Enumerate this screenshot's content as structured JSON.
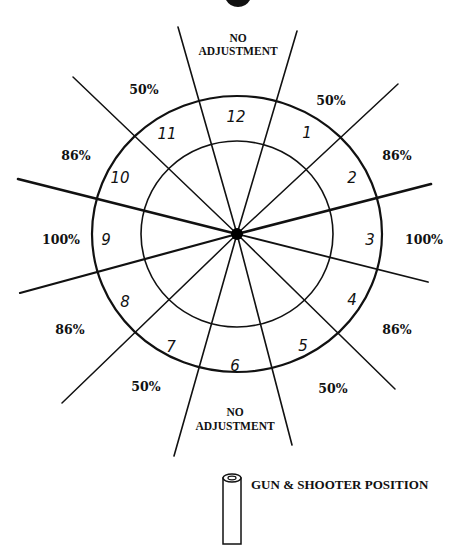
{
  "diagram": {
    "center": {
      "x": 237,
      "y": 234
    },
    "outer_ring": {
      "rx": 145,
      "ry": 138
    },
    "inner_ring": {
      "rx": 96,
      "ry": 93
    },
    "line_color": "#111111",
    "spokes": [
      {
        "name": "spoke-top-left",
        "x": 178,
        "y": 27,
        "w": 1.6
      },
      {
        "name": "spoke-top-right",
        "x": 297,
        "y": 31,
        "w": 1.6
      },
      {
        "name": "spoke-upper-right",
        "x": 398,
        "y": 84,
        "w": 1.5
      },
      {
        "name": "spoke-right-upper",
        "x": 431,
        "y": 184,
        "w": 2.6
      },
      {
        "name": "spoke-right-lower",
        "x": 428,
        "y": 282,
        "w": 1.8
      },
      {
        "name": "spoke-lower-right",
        "x": 395,
        "y": 389,
        "w": 1.5
      },
      {
        "name": "spoke-bottom-right",
        "x": 292,
        "y": 445,
        "w": 1.6
      },
      {
        "name": "spoke-bottom-left",
        "x": 174,
        "y": 456,
        "w": 1.6
      },
      {
        "name": "spoke-lower-left",
        "x": 62,
        "y": 403,
        "w": 1.5
      },
      {
        "name": "spoke-left-lower",
        "x": 20,
        "y": 293,
        "w": 2.2
      },
      {
        "name": "spoke-left-upper",
        "x": 18,
        "y": 179,
        "w": 2.6
      },
      {
        "name": "spoke-upper-left",
        "x": 73,
        "y": 77,
        "w": 1.5
      }
    ],
    "hours": [
      {
        "label": "12",
        "x": 236,
        "y": 117
      },
      {
        "label": "1",
        "x": 307,
        "y": 133
      },
      {
        "label": "2",
        "x": 352,
        "y": 178
      },
      {
        "label": "3",
        "x": 370,
        "y": 240
      },
      {
        "label": "4",
        "x": 352,
        "y": 300
      },
      {
        "label": "5",
        "x": 303,
        "y": 346
      },
      {
        "label": "6",
        "x": 235,
        "y": 366
      },
      {
        "label": "7",
        "x": 171,
        "y": 347
      },
      {
        "label": "8",
        "x": 125,
        "y": 302
      },
      {
        "label": "9",
        "x": 106,
        "y": 240
      },
      {
        "label": "10",
        "x": 120,
        "y": 178
      },
      {
        "label": "11",
        "x": 167,
        "y": 134
      }
    ],
    "percent_labels": [
      {
        "label": "50%",
        "x": 331,
        "y": 101
      },
      {
        "label": "86%",
        "x": 397,
        "y": 156
      },
      {
        "label": "100%",
        "x": 424,
        "y": 240
      },
      {
        "label": "86%",
        "x": 397,
        "y": 330
      },
      {
        "label": "50%",
        "x": 333,
        "y": 389
      },
      {
        "label": "50%",
        "x": 146,
        "y": 387
      },
      {
        "label": "86%",
        "x": 70,
        "y": 330
      },
      {
        "label": "100%",
        "x": 61,
        "y": 240
      },
      {
        "label": "86%",
        "x": 76,
        "y": 156
      },
      {
        "label": "50%",
        "x": 144,
        "y": 90
      }
    ],
    "no_adjustment_top": {
      "line1": "NO",
      "line2": "ADJUSTMENT",
      "x": 238,
      "y1": 42,
      "y2": 55
    },
    "no_adjustment_bottom": {
      "line1": "NO",
      "line2": "ADJUSTMENT",
      "x": 235,
      "y1": 416,
      "y2": 430
    }
  },
  "legend": {
    "label": "GUN & SHOOTER POSITION",
    "icon": "gun-barrel-icon",
    "x": 251,
    "y": 489
  }
}
